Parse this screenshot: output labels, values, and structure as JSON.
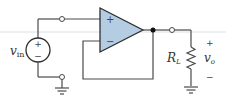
{
  "diagram": {
    "source": {
      "label_main": "v",
      "label_sub": "in",
      "plus": "+",
      "minus": "−"
    },
    "opamp": {
      "noninverting": "+",
      "inverting": "−",
      "fill": "#b5cde3",
      "stroke": "#2f2f2f"
    },
    "load": {
      "label_main": "R",
      "label_sub": "L"
    },
    "output": {
      "label_main": "v",
      "label_sub": "o",
      "plus": "+",
      "minus": "−"
    },
    "colors": {
      "wire": "#4a4a4a",
      "guide_line": "#d5dde3"
    }
  }
}
